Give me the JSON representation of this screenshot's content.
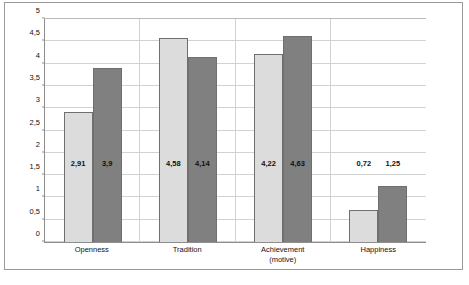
{
  "chart_data": {
    "type": "bar",
    "title": "",
    "xlabel": "",
    "ylabel": "",
    "categories": [
      "Openness",
      "Tradition",
      "Achievement\n(motive)",
      "Happiness"
    ],
    "category_lines": [
      [
        "Openness"
      ],
      [
        "Tradition"
      ],
      [
        "Achievement",
        "(motive)"
      ],
      [
        "Happiness"
      ]
    ],
    "series": [
      {
        "name": "Low education",
        "values": [
          2.91,
          4.58,
          4.22,
          0.72
        ],
        "color": "#dcdcdc"
      },
      {
        "name": "High education",
        "values": [
          3.9,
          4.14,
          4.63,
          1.25
        ],
        "color": "#808080"
      }
    ],
    "value_labels": [
      [
        "2,91",
        "3,9"
      ],
      [
        "4,58",
        "4,14"
      ],
      [
        "4,22",
        "4,63"
      ],
      [
        "0,72",
        "1,25"
      ]
    ],
    "ylim": [
      0,
      5
    ],
    "ytick_values": [
      0,
      0.5,
      1,
      1.5,
      2,
      2.5,
      3,
      3.5,
      4,
      4.5,
      5
    ],
    "ytick_labels": [
      "0",
      "0,5",
      "1",
      "1,5",
      "2",
      "2,5",
      "3",
      "3,5",
      "4",
      "4,5",
      "5"
    ],
    "grid": true,
    "grid_axis": "y",
    "legend_position": "top-right",
    "decimal_separator": ","
  },
  "legend": {
    "items": [
      {
        "label": "Low education",
        "swatch": "low"
      },
      {
        "label": "High education",
        "swatch": "high"
      }
    ]
  },
  "caption": {
    "text": ""
  }
}
